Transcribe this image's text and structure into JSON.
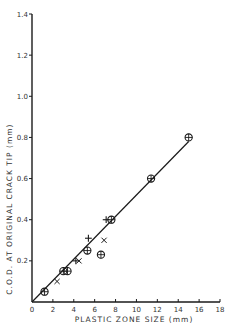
{
  "chart_data": {
    "type": "scatter",
    "title": "",
    "xlabel": "PLASTIC ZONE SIZE  (mm)",
    "ylabel": "C.O.D. AT ORIGINAL CRACK TIP  (mm)",
    "xlim": [
      0,
      18
    ],
    "ylim": [
      0,
      1.4
    ],
    "x_ticks": [
      0,
      2,
      4,
      6,
      8,
      10,
      12,
      14,
      16,
      18
    ],
    "x_tick_labels": [
      "0",
      "2",
      "4",
      "6",
      "8",
      "10",
      "12",
      "14",
      "16",
      "18"
    ],
    "y_ticks": [
      0.2,
      0.4,
      0.6,
      0.8,
      1.0,
      1.2,
      1.4
    ],
    "y_tick_labels": [
      "0.2",
      "0.4",
      "0.6",
      "0.8",
      "1.0",
      "1.2",
      "1.4"
    ],
    "origin_label": "0",
    "grid": false,
    "legend": null,
    "series": [
      {
        "name": "circle-plus",
        "marker": "circle-plus",
        "points": [
          [
            1.2,
            0.05
          ],
          [
            3.0,
            0.15
          ],
          [
            3.4,
            0.15
          ],
          [
            5.3,
            0.25
          ],
          [
            6.6,
            0.23
          ],
          [
            7.6,
            0.4
          ],
          [
            11.4,
            0.6
          ],
          [
            15.0,
            0.8
          ]
        ]
      },
      {
        "name": "cross",
        "marker": "x",
        "points": [
          [
            2.4,
            0.1
          ],
          [
            4.5,
            0.2
          ],
          [
            6.9,
            0.3
          ]
        ]
      },
      {
        "name": "plus",
        "marker": "+",
        "points": [
          [
            4.2,
            0.2
          ],
          [
            5.4,
            0.31
          ],
          [
            7.1,
            0.4
          ]
        ]
      }
    ],
    "fit_line": {
      "from": [
        0,
        0
      ],
      "to": [
        15.0,
        0.78
      ]
    }
  }
}
